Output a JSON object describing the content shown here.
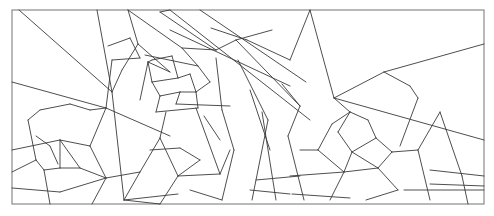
{
  "artwork": {
    "title": "Geometric line-art pattern with two spiral centers",
    "stroke_color": "#3a3a3a",
    "frame_color": "#8a8a8a",
    "background": "#ffffff",
    "frame": {
      "x": 12,
      "y": 10,
      "w": 472,
      "h": 194
    },
    "segments": [
      [
        19,
        10,
        112,
        92
      ],
      [
        97,
        10,
        112,
        92
      ],
      [
        112,
        92,
        124,
        200
      ],
      [
        12,
        82,
        106,
        108
      ],
      [
        106,
        108,
        170,
        136
      ],
      [
        128,
        10,
        138,
        44
      ],
      [
        138,
        44,
        122,
        70
      ],
      [
        122,
        70,
        112,
        92
      ],
      [
        138,
        44,
        170,
        72
      ],
      [
        128,
        10,
        182,
        48
      ],
      [
        108,
        46,
        130,
        38
      ],
      [
        130,
        38,
        140,
        58
      ],
      [
        112,
        60,
        140,
        58
      ],
      [
        112,
        60,
        106,
        108
      ],
      [
        160,
        12,
        216,
        50
      ],
      [
        182,
        48,
        216,
        50
      ],
      [
        216,
        50,
        236,
        40
      ],
      [
        236,
        40,
        272,
        30
      ],
      [
        152,
        60,
        172,
        56
      ],
      [
        172,
        56,
        178,
        78
      ],
      [
        178,
        78,
        152,
        82
      ],
      [
        152,
        82,
        148,
        62
      ],
      [
        148,
        62,
        152,
        60
      ],
      [
        148,
        62,
        140,
        100
      ],
      [
        152,
        82,
        160,
        96
      ],
      [
        160,
        96,
        180,
        92
      ],
      [
        178,
        78,
        190,
        74
      ],
      [
        190,
        74,
        196,
        92
      ],
      [
        196,
        92,
        180,
        92
      ],
      [
        180,
        92,
        176,
        104
      ],
      [
        160,
        96,
        156,
        112
      ],
      [
        156,
        112,
        198,
        108
      ],
      [
        198,
        108,
        196,
        92
      ],
      [
        145,
        55,
        198,
        66
      ],
      [
        198,
        66,
        210,
        82
      ],
      [
        210,
        82,
        196,
        92
      ],
      [
        182,
        48,
        198,
        66
      ],
      [
        170,
        72,
        148,
        62
      ],
      [
        166,
        112,
        160,
        138
      ],
      [
        176,
        104,
        230,
        106
      ],
      [
        160,
        12,
        170,
        10
      ],
      [
        170,
        10,
        310,
        120
      ],
      [
        200,
        10,
        306,
        82
      ],
      [
        211,
        28,
        247,
        40
      ],
      [
        247,
        40,
        290,
        60
      ],
      [
        170,
        30,
        290,
        86
      ],
      [
        236,
        40,
        300,
        106
      ],
      [
        290,
        60,
        310,
        10
      ],
      [
        238,
        60,
        268,
        120
      ],
      [
        268,
        120,
        252,
        200
      ],
      [
        250,
        90,
        270,
        150
      ],
      [
        216,
        58,
        222,
        110
      ],
      [
        222,
        110,
        234,
        150
      ],
      [
        234,
        150,
        222,
        200
      ],
      [
        262,
        112,
        276,
        200
      ],
      [
        282,
        84,
        300,
        106
      ],
      [
        300,
        106,
        288,
        136
      ],
      [
        288,
        136,
        304,
        200
      ],
      [
        310,
        10,
        334,
        98
      ],
      [
        334,
        98,
        384,
        72
      ],
      [
        384,
        72,
        484,
        44
      ],
      [
        384,
        72,
        410,
        86
      ],
      [
        410,
        86,
        418,
        98
      ],
      [
        418,
        98,
        400,
        146
      ],
      [
        334,
        98,
        484,
        140
      ],
      [
        334,
        98,
        350,
        112
      ],
      [
        350,
        112,
        332,
        124
      ],
      [
        332,
        124,
        318,
        150
      ],
      [
        350,
        112,
        368,
        120
      ],
      [
        368,
        120,
        376,
        138
      ],
      [
        376,
        138,
        352,
        152
      ],
      [
        352,
        152,
        338,
        132
      ],
      [
        338,
        132,
        350,
        112
      ],
      [
        376,
        138,
        392,
        152
      ],
      [
        392,
        152,
        378,
        168
      ],
      [
        378,
        168,
        352,
        152
      ],
      [
        352,
        152,
        344,
        172
      ],
      [
        344,
        172,
        378,
        168
      ],
      [
        318,
        150,
        344,
        172
      ],
      [
        344,
        172,
        330,
        200
      ],
      [
        378,
        168,
        398,
        190
      ],
      [
        398,
        190,
        366,
        200
      ],
      [
        392,
        152,
        418,
        150
      ],
      [
        418,
        150,
        430,
        200
      ],
      [
        418,
        150,
        440,
        112
      ],
      [
        440,
        112,
        462,
        176
      ],
      [
        462,
        176,
        468,
        204
      ],
      [
        430,
        170,
        484,
        176
      ],
      [
        430,
        184,
        484,
        186
      ],
      [
        404,
        190,
        484,
        190
      ],
      [
        300,
        150,
        318,
        150
      ],
      [
        290,
        176,
        344,
        172
      ],
      [
        292,
        194,
        350,
        198
      ],
      [
        256,
        180,
        300,
        176
      ],
      [
        250,
        190,
        290,
        194
      ],
      [
        12,
        150,
        60,
        140
      ],
      [
        60,
        140,
        90,
        146
      ],
      [
        90,
        146,
        106,
        108
      ],
      [
        28,
        120,
        40,
        110
      ],
      [
        40,
        110,
        70,
        104
      ],
      [
        70,
        104,
        90,
        110
      ],
      [
        90,
        110,
        106,
        108
      ],
      [
        28,
        120,
        36,
        160
      ],
      [
        36,
        160,
        12,
        172
      ],
      [
        36,
        160,
        44,
        170
      ],
      [
        44,
        170,
        60,
        168
      ],
      [
        60,
        168,
        60,
        140
      ],
      [
        60,
        140,
        80,
        168
      ],
      [
        80,
        168,
        60,
        168
      ],
      [
        44,
        170,
        50,
        204
      ],
      [
        50,
        146,
        58,
        164
      ],
      [
        36,
        136,
        50,
        146
      ],
      [
        90,
        146,
        106,
        178
      ],
      [
        106,
        178,
        80,
        168
      ],
      [
        106,
        178,
        92,
        204
      ],
      [
        106,
        178,
        140,
        172
      ],
      [
        140,
        172,
        160,
        138
      ],
      [
        140,
        172,
        124,
        200
      ],
      [
        124,
        200,
        160,
        204
      ],
      [
        12,
        188,
        60,
        192
      ],
      [
        60,
        192,
        106,
        178
      ],
      [
        160,
        138,
        178,
        176
      ],
      [
        178,
        176,
        160,
        204
      ],
      [
        178,
        176,
        220,
        174
      ],
      [
        220,
        174,
        230,
        150
      ],
      [
        196,
        108,
        220,
        174
      ],
      [
        124,
        200,
        178,
        194
      ],
      [
        190,
        190,
        222,
        200
      ],
      [
        150,
        150,
        180,
        148
      ],
      [
        180,
        148,
        200,
        160
      ],
      [
        200,
        160,
        178,
        176
      ],
      [
        204,
        116,
        220,
        140
      ]
    ]
  }
}
